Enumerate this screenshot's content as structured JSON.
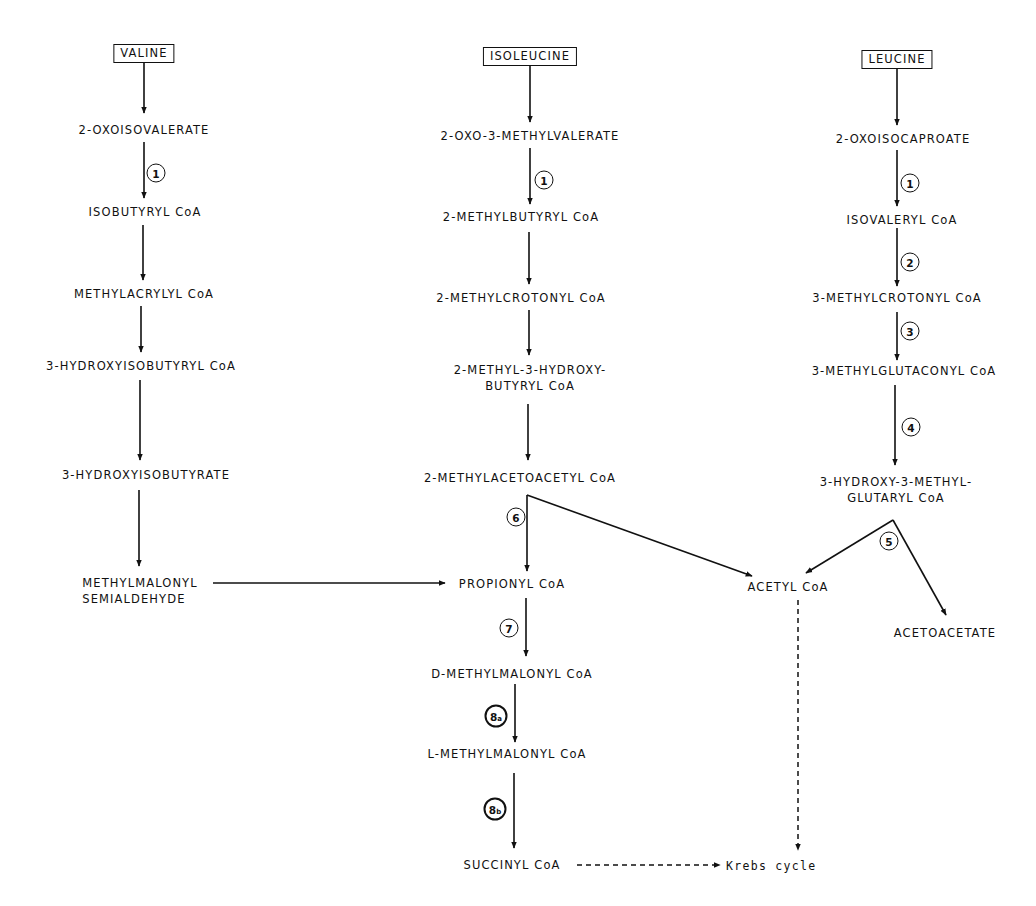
{
  "pathways": {
    "valine": {
      "start": "VALINE",
      "steps": [
        "2-OXOISOVALERATE",
        "ISOBUTYRYL CoA",
        "METHYLACRYLYL CoA",
        "3-HYDROXYISOBUTYRYL CoA",
        "3-HYDROXYISOBUTYRATE"
      ],
      "end_line1": "METHYLMALONYL",
      "end_line2": "SEMIALDEHYDE"
    },
    "isoleucine": {
      "start": "ISOLEUCINE",
      "steps": [
        "2-OXO-3-METHYLVALERATE",
        "2-METHYLBUTYRYL CoA",
        "2-METHYLCROTONYL CoA"
      ],
      "hydroxy_line1": "2-METHYL-3-HYDROXY-",
      "hydroxy_line2": "BUTYRYL CoA",
      "acetoacetyl": "2-METHYLACETOACETYL CoA"
    },
    "leucine": {
      "start": "LEUCINE",
      "steps": [
        "2-OXOISOCAPROATE",
        "ISOVALERYL CoA",
        "3-METHYLCROTONYL CoA",
        "3-METHYLGLUTACONYL CoA"
      ],
      "hmg_line1": "3-HYDROXY-3-METHYL-",
      "hmg_line2": "GLUTARYL CoA",
      "acetoacetate": "ACETOACETATE"
    },
    "common": {
      "propionyl": "PROPIONYL CoA",
      "d_methylmalonyl": "D-METHYLMALONYL CoA",
      "l_methylmalonyl": "L-METHYLMALONYL CoA",
      "succinyl": "SUCCINYL CoA",
      "acetyl": "ACETYL CoA",
      "krebs": "Krebs cycle"
    }
  },
  "enzyme_steps": {
    "valine_1": "1",
    "isoleucine_1": "1",
    "leucine_1": "1",
    "leucine_2": "2",
    "leucine_3": "3",
    "leucine_4": "4",
    "leucine_5": "5",
    "isoleucine_6": "6",
    "propionyl_7": "7",
    "mutase_8a_num": "8",
    "mutase_8a_sub": "a",
    "mutase_8b_num": "8",
    "mutase_8b_sub": "b"
  }
}
